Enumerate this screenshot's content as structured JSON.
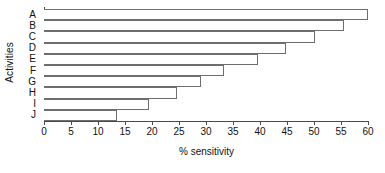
{
  "chart_data": {
    "type": "bar",
    "orientation": "horizontal",
    "title": "",
    "xlabel": "% sensitivity",
    "ylabel": "Activities",
    "categories": [
      "A",
      "B",
      "C",
      "D",
      "E",
      "F",
      "G",
      "H",
      "I",
      "J"
    ],
    "values": [
      60.0,
      55.5,
      50.2,
      44.8,
      39.6,
      33.4,
      29.1,
      24.7,
      19.4,
      13.5
    ],
    "series": [
      {
        "name": "% sensitivity",
        "values": [
          60.0,
          55.5,
          50.2,
          44.8,
          39.6,
          33.4,
          29.1,
          24.7,
          19.4,
          13.5
        ]
      }
    ],
    "xlim": [
      0,
      60
    ],
    "xticks": [
      0,
      5,
      10,
      15,
      20,
      25,
      30,
      35,
      40,
      45,
      50,
      55,
      60
    ],
    "xtick_labels": [
      "0",
      "5",
      "10",
      "15",
      "20",
      "25",
      "30",
      "35",
      "40",
      "45",
      "50",
      "55",
      "60"
    ],
    "grid": false,
    "legend": null,
    "bar_fill_color": "#ffffff",
    "bar_edge_color": "#6e6e6e",
    "axis_color": "#4a4a4a",
    "background_color": "#ffffff"
  }
}
